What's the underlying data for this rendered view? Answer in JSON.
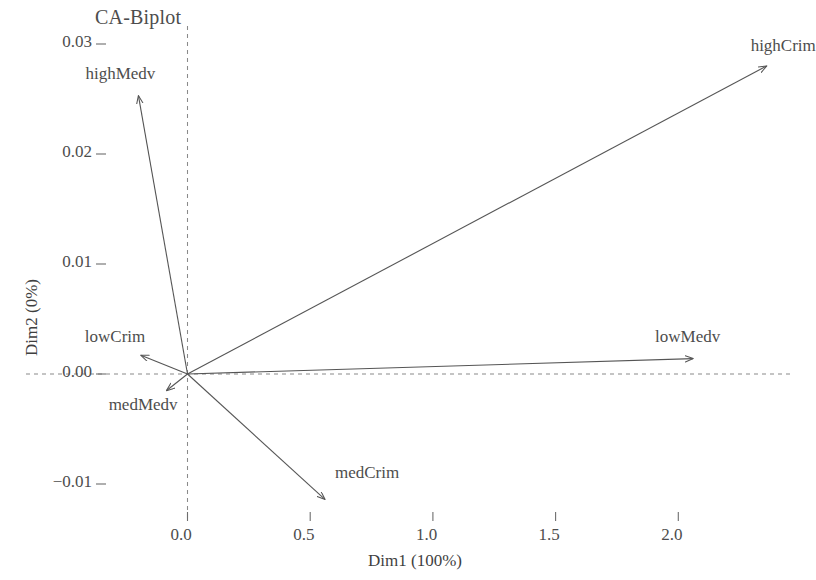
{
  "chart_data": {
    "type": "scatter",
    "subtype": "biplot-vectors",
    "title": "CA-Biplot",
    "xlabel": "Dim1 (100%)",
    "ylabel": "Dim2 (0%)",
    "xlim": [
      -0.3,
      2.55
    ],
    "ylim": [
      -0.0135,
      0.0315
    ],
    "xticks": [
      0.0,
      0.5,
      1.0,
      1.5,
      2.0
    ],
    "xtick_labels": [
      "0.0",
      "0.5",
      "1.0",
      "1.5",
      "2.0"
    ],
    "yticks": [
      -0.01,
      0.0,
      0.01,
      0.02,
      0.03
    ],
    "ytick_labels": [
      "−0.01",
      "0.00",
      "0.01",
      "0.02",
      "0.03"
    ],
    "grid": false,
    "reference_lines": [
      {
        "name": "horizontal-zero-line",
        "axis": "y",
        "value": 0.0,
        "style": "dashed"
      },
      {
        "name": "vertical-zero-line",
        "axis": "x",
        "value": 0.0,
        "style": "dashed"
      }
    ],
    "origin": [
      0.0,
      0.0
    ],
    "legend": null,
    "vectors": [
      {
        "label": "highCrim",
        "x": 2.36,
        "y": 0.028,
        "label_pos": "above-right"
      },
      {
        "label": "lowMedv",
        "x": 2.06,
        "y": 0.0014,
        "label_pos": "above"
      },
      {
        "label": "medCrim",
        "x": 0.56,
        "y": -0.0114,
        "label_pos": "right"
      },
      {
        "label": "highMedv",
        "x": -0.2,
        "y": 0.0253,
        "label_pos": "above"
      },
      {
        "label": "lowCrim",
        "x": -0.19,
        "y": 0.0017,
        "label_pos": "above-left"
      },
      {
        "label": "medMedv",
        "x": -0.085,
        "y": -0.0015,
        "label_pos": "below-left"
      }
    ],
    "colors": {
      "vector": "#555555",
      "reference_line": "#777777",
      "text": "#4d4d4d",
      "background": "#ffffff"
    }
  },
  "chart": {
    "title": "CA-Biplot",
    "x_axis_title": "Dim1 (100%)",
    "y_axis_title": "Dim2 (0%)",
    "x_tick_labels": [
      "0.0",
      "0.5",
      "1.0",
      "1.5",
      "2.0"
    ],
    "y_tick_labels": [
      "0.03",
      "0.02",
      "0.01",
      "0.00",
      "−0.01"
    ],
    "vector_labels": {
      "highCrim": "highCrim",
      "lowMedv": "lowMedv",
      "medCrim": "medCrim",
      "highMedv": "highMedv",
      "lowCrim": "lowCrim",
      "medMedv": "medMedv"
    }
  }
}
